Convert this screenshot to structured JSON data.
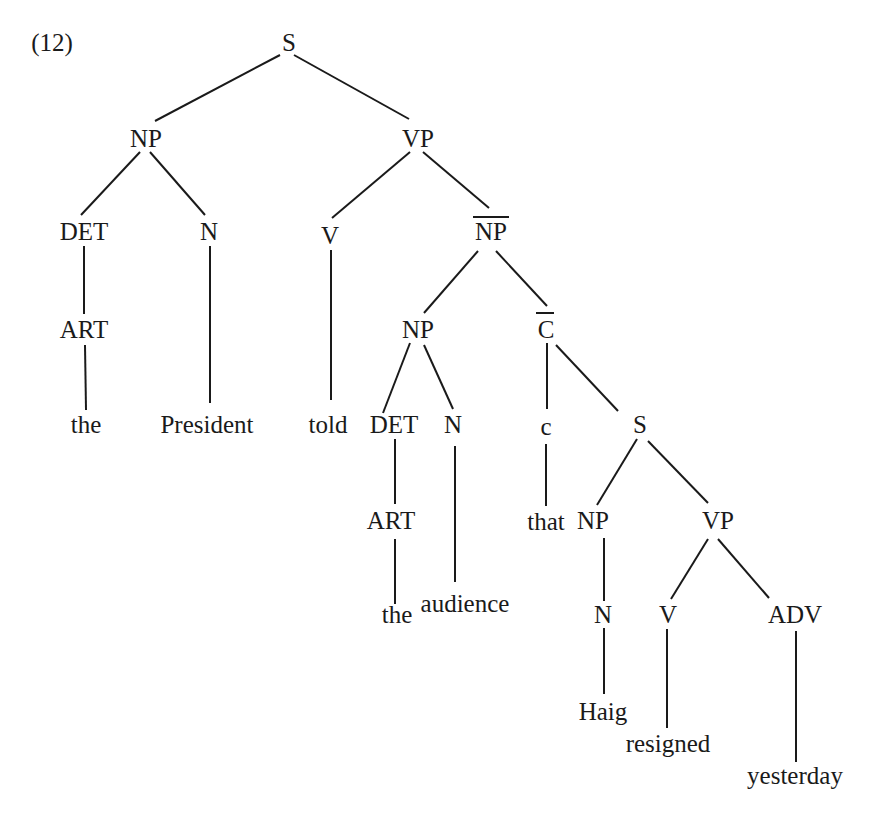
{
  "example_number": "(12)",
  "diagram": {
    "type": "syntax-tree",
    "sentence": "the President told the audience that Haig resigned yesterday",
    "nodes": [
      {
        "id": "s1",
        "label": "S",
        "x": 289,
        "y": 42,
        "bar": false
      },
      {
        "id": "np1",
        "label": "NP",
        "x": 146,
        "y": 138,
        "bar": false
      },
      {
        "id": "vp1",
        "label": "VP",
        "x": 418,
        "y": 138,
        "bar": false
      },
      {
        "id": "det1",
        "label": "DET",
        "x": 84,
        "y": 231,
        "bar": false
      },
      {
        "id": "n1",
        "label": "N",
        "x": 209,
        "y": 231,
        "bar": false
      },
      {
        "id": "v1",
        "label": "V",
        "x": 330,
        "y": 235,
        "bar": false
      },
      {
        "id": "npbar",
        "label": "NP",
        "x": 491,
        "y": 231,
        "bar": true
      },
      {
        "id": "art1",
        "label": "ART",
        "x": 84,
        "y": 329,
        "bar": false
      },
      {
        "id": "np2",
        "label": "NP",
        "x": 418,
        "y": 329,
        "bar": false
      },
      {
        "id": "cbar",
        "label": "C",
        "x": 546,
        "y": 329,
        "bar": true
      },
      {
        "id": "w_the1",
        "label": "the",
        "x": 86,
        "y": 424,
        "bar": false
      },
      {
        "id": "w_pres",
        "label": "President",
        "x": 207,
        "y": 424,
        "bar": false
      },
      {
        "id": "w_told",
        "label": "told",
        "x": 328,
        "y": 424,
        "bar": false
      },
      {
        "id": "det2",
        "label": "DET",
        "x": 394,
        "y": 424,
        "bar": false
      },
      {
        "id": "n2",
        "label": "N",
        "x": 453,
        "y": 424,
        "bar": false
      },
      {
        "id": "c1",
        "label": "c",
        "x": 546,
        "y": 426,
        "bar": false
      },
      {
        "id": "s2",
        "label": "S",
        "x": 640,
        "y": 424,
        "bar": false
      },
      {
        "id": "art2",
        "label": "ART",
        "x": 391,
        "y": 520,
        "bar": false
      },
      {
        "id": "w_that",
        "label": "that",
        "x": 546,
        "y": 521,
        "bar": false
      },
      {
        "id": "np3",
        "label": "NP",
        "x": 593,
        "y": 520,
        "bar": false
      },
      {
        "id": "vp2",
        "label": "VP",
        "x": 718,
        "y": 520,
        "bar": false
      },
      {
        "id": "w_the2",
        "label": "the",
        "x": 397,
        "y": 614,
        "bar": false
      },
      {
        "id": "w_aud",
        "label": "audience",
        "x": 465,
        "y": 603,
        "bar": false
      },
      {
        "id": "n3",
        "label": "N",
        "x": 603,
        "y": 614,
        "bar": false
      },
      {
        "id": "v2",
        "label": "V",
        "x": 668,
        "y": 614,
        "bar": false
      },
      {
        "id": "adv1",
        "label": "ADV",
        "x": 795,
        "y": 614,
        "bar": false
      },
      {
        "id": "w_haig",
        "label": "Haig",
        "x": 603,
        "y": 711,
        "bar": false
      },
      {
        "id": "w_res",
        "label": "resigned",
        "x": 668,
        "y": 743,
        "bar": false
      },
      {
        "id": "w_yest",
        "label": "yesterday",
        "x": 795,
        "y": 775,
        "bar": false
      }
    ],
    "edges": [
      {
        "from": "s1",
        "to": "np1",
        "x1": 280,
        "y1": 55,
        "x2": 155,
        "y2": 121
      },
      {
        "from": "s1",
        "to": "vp1",
        "x1": 294,
        "y1": 55,
        "x2": 409,
        "y2": 119
      },
      {
        "from": "np1",
        "to": "det1",
        "x1": 140,
        "y1": 152,
        "x2": 81,
        "y2": 215
      },
      {
        "from": "np1",
        "to": "n1",
        "x1": 150,
        "y1": 152,
        "x2": 205,
        "y2": 215
      },
      {
        "from": "vp1",
        "to": "v1",
        "x1": 410,
        "y1": 152,
        "x2": 332,
        "y2": 218
      },
      {
        "from": "vp1",
        "to": "npbar",
        "x1": 423,
        "y1": 152,
        "x2": 489,
        "y2": 208
      },
      {
        "from": "det1",
        "to": "art1",
        "x1": 84,
        "y1": 246,
        "x2": 84,
        "y2": 314
      },
      {
        "from": "n1",
        "to": "w_pres",
        "x1": 210,
        "y1": 246,
        "x2": 210,
        "y2": 403
      },
      {
        "from": "v1",
        "to": "w_told",
        "x1": 331,
        "y1": 250,
        "x2": 331,
        "y2": 400
      },
      {
        "from": "npbar",
        "to": "np2",
        "x1": 478,
        "y1": 251,
        "x2": 424,
        "y2": 313
      },
      {
        "from": "npbar",
        "to": "cbar",
        "x1": 496,
        "y1": 251,
        "x2": 547,
        "y2": 306
      },
      {
        "from": "art1",
        "to": "w_the1",
        "x1": 85,
        "y1": 345,
        "x2": 86,
        "y2": 410
      },
      {
        "from": "np2",
        "to": "det2",
        "x1": 410,
        "y1": 343,
        "x2": 383,
        "y2": 413
      },
      {
        "from": "np2",
        "to": "n2",
        "x1": 424,
        "y1": 345,
        "x2": 453,
        "y2": 409
      },
      {
        "from": "cbar",
        "to": "c1",
        "x1": 547,
        "y1": 343,
        "x2": 547,
        "y2": 409
      },
      {
        "from": "cbar",
        "to": "s2",
        "x1": 556,
        "y1": 345,
        "x2": 618,
        "y2": 411
      },
      {
        "from": "det2",
        "to": "art2",
        "x1": 395,
        "y1": 439,
        "x2": 395,
        "y2": 504
      },
      {
        "from": "n2",
        "to": "w_aud",
        "x1": 455,
        "y1": 446,
        "x2": 455,
        "y2": 582
      },
      {
        "from": "c1",
        "to": "w_that",
        "x1": 546,
        "y1": 444,
        "x2": 546,
        "y2": 506
      },
      {
        "from": "s2",
        "to": "np3",
        "x1": 637,
        "y1": 439,
        "x2": 597,
        "y2": 505
      },
      {
        "from": "s2",
        "to": "vp2",
        "x1": 648,
        "y1": 441,
        "x2": 708,
        "y2": 503
      },
      {
        "from": "art2",
        "to": "w_the2",
        "x1": 395,
        "y1": 539,
        "x2": 395,
        "y2": 604
      },
      {
        "from": "np3",
        "to": "n3",
        "x1": 604,
        "y1": 538,
        "x2": 604,
        "y2": 601
      },
      {
        "from": "vp2",
        "to": "v2",
        "x1": 708,
        "y1": 539,
        "x2": 671,
        "y2": 599
      },
      {
        "from": "vp2",
        "to": "adv1",
        "x1": 718,
        "y1": 539,
        "x2": 769,
        "y2": 598
      },
      {
        "from": "n3",
        "to": "w_haig",
        "x1": 604,
        "y1": 628,
        "x2": 604,
        "y2": 694
      },
      {
        "from": "v2",
        "to": "w_res",
        "x1": 667,
        "y1": 629,
        "x2": 667,
        "y2": 728
      },
      {
        "from": "adv1",
        "to": "w_yest",
        "x1": 796,
        "y1": 631,
        "x2": 796,
        "y2": 762
      }
    ],
    "overbars": [
      {
        "node": "npbar",
        "x1": 473,
        "y1": 217,
        "x2": 509,
        "y2": 217
      },
      {
        "node": "cbar",
        "x1": 536,
        "y1": 313,
        "x2": 554,
        "y2": 313
      }
    ]
  }
}
